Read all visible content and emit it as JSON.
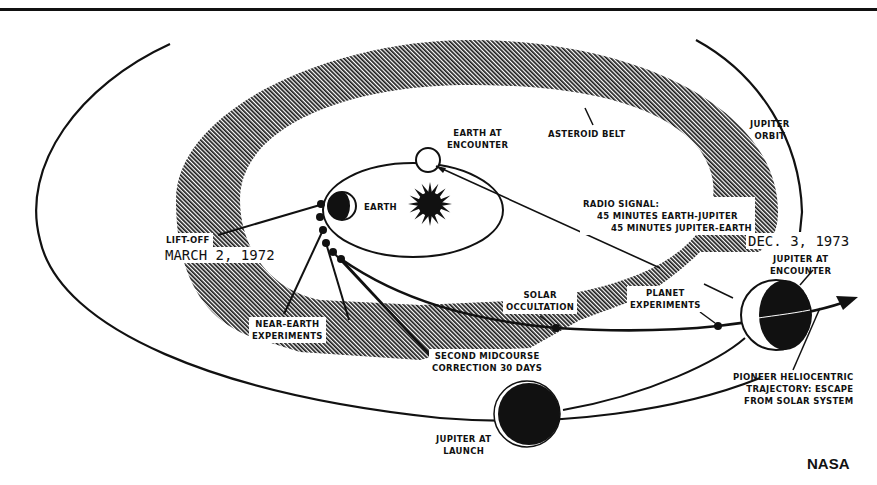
{
  "figure": {
    "credit": "NASA",
    "colors": {
      "ink": "#111111",
      "paper": "#ffffff"
    }
  },
  "labels": {
    "asteroid_belt": "ASTEROID BELT",
    "jupiter_orbit": [
      "JUPITER",
      "ORBIT"
    ],
    "earth_at_encounter": [
      "EARTH AT",
      "ENCOUNTER"
    ],
    "earth": "EARTH",
    "radio_signal": [
      "RADIO SIGNAL:",
      "45 MINUTES EARTH-JUPITER",
      "45 MINUTES JUPITER-EARTH"
    ],
    "lift_off": "LIFT-OFF",
    "lift_off_date": "MARCH 2, 1972",
    "encounter_date": "DEC. 3, 1973",
    "jupiter_at_encounter": [
      "JUPITER AT",
      "ENCOUNTER"
    ],
    "solar_occultation": [
      "SOLAR",
      "OCCULTATION"
    ],
    "planet_experiments": [
      "PLANET",
      "EXPERIMENTS"
    ],
    "near_earth_experiments": [
      "NEAR-EARTH",
      "EXPERIMENTS"
    ],
    "second_midcourse": [
      "SECOND MIDCOURSE",
      "CORRECTION 30 DAYS"
    ],
    "pioneer_trajectory": [
      "PIONEER HELIOCENTRIC",
      "TRAJECTORY: ESCAPE",
      "FROM SOLAR SYSTEM"
    ],
    "jupiter_at_launch": [
      "JUPITER AT",
      "LAUNCH"
    ]
  },
  "icons": {
    "sun": "sun-icon",
    "earth": "earth-icon",
    "jupiter": "jupiter-icon",
    "spacecraft": "spacecraft-marker-icon",
    "arrow": "arrow-head-icon"
  }
}
